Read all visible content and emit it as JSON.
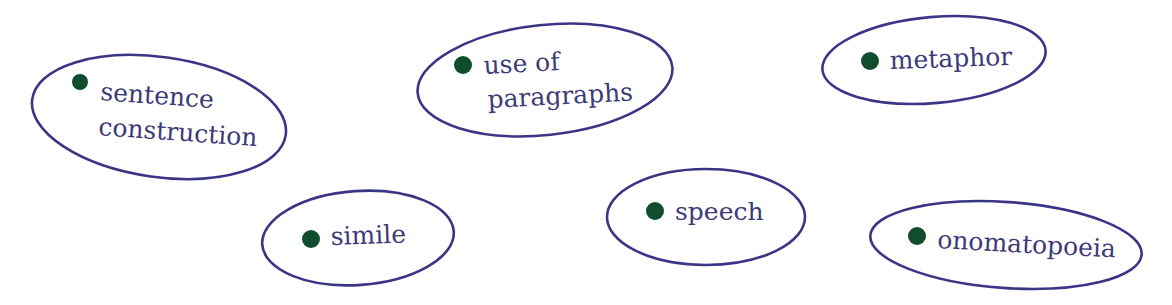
{
  "diagram": {
    "type": "bubble-list",
    "colors": {
      "background": "#ffffff",
      "ellipse_stroke": "#3b3585",
      "bullet_fill": "#0f4d2e",
      "text": "#3d3a78"
    },
    "nodes": [
      {
        "id": "sentence-construction",
        "lines": [
          "sentence",
          "construction"
        ],
        "ellipse": {
          "cx": 159,
          "cy": 117,
          "rx": 128,
          "ry": 60,
          "rotate": 8
        },
        "bullet": {
          "cx": 80,
          "cy": 82,
          "r": 8
        },
        "text_pos": [
          {
            "x": 100,
            "y": 100
          },
          {
            "x": 98,
            "y": 135
          }
        ],
        "text_rotate": 4
      },
      {
        "id": "use-of-paragraphs",
        "lines": [
          "use of",
          "paragraphs"
        ],
        "ellipse": {
          "cx": 545,
          "cy": 80,
          "rx": 128,
          "ry": 55,
          "rotate": -6
        },
        "bullet": {
          "cx": 463,
          "cy": 65,
          "r": 9
        },
        "text_pos": [
          {
            "x": 484,
            "y": 74
          },
          {
            "x": 488,
            "y": 108
          }
        ],
        "text_rotate": -3
      },
      {
        "id": "metaphor",
        "lines": [
          "metaphor"
        ],
        "ellipse": {
          "cx": 934,
          "cy": 60,
          "rx": 112,
          "ry": 43,
          "rotate": -5
        },
        "bullet": {
          "cx": 870,
          "cy": 61,
          "r": 9
        },
        "text_pos": [
          {
            "x": 890,
            "y": 69
          }
        ],
        "text_rotate": -2
      },
      {
        "id": "simile",
        "lines": [
          "simile"
        ],
        "ellipse": {
          "cx": 358,
          "cy": 238,
          "rx": 96,
          "ry": 47,
          "rotate": -4
        },
        "bullet": {
          "cx": 311,
          "cy": 239,
          "r": 9
        },
        "text_pos": [
          {
            "x": 331,
            "y": 245
          }
        ],
        "text_rotate": -2
      },
      {
        "id": "speech",
        "lines": [
          "speech"
        ],
        "ellipse": {
          "cx": 706,
          "cy": 217,
          "rx": 99,
          "ry": 48,
          "rotate": 0
        },
        "bullet": {
          "cx": 655,
          "cy": 211,
          "r": 9
        },
        "text_pos": [
          {
            "x": 675,
            "y": 220
          }
        ],
        "text_rotate": 0
      },
      {
        "id": "onomatopoeia",
        "lines": [
          "onomatopoeia"
        ],
        "ellipse": {
          "cx": 1006,
          "cy": 245,
          "rx": 136,
          "ry": 43,
          "rotate": 4
        },
        "bullet": {
          "cx": 917,
          "cy": 236,
          "r": 9
        },
        "text_pos": [
          {
            "x": 937,
            "y": 248
          }
        ],
        "text_rotate": 3
      }
    ]
  }
}
